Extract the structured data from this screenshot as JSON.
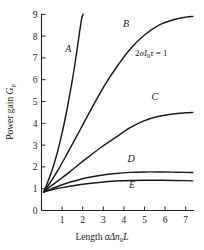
{
  "chart_data": {
    "type": "line",
    "title": "",
    "xlabel": "Length σΔn₀L",
    "ylabel": "Power gain Gₚ",
    "xlim": [
      0,
      7.45
    ],
    "ylim": [
      0,
      9
    ],
    "xticks": [
      1,
      2,
      3,
      4,
      5,
      6,
      7
    ],
    "yticks": [
      0,
      1,
      2,
      3,
      4,
      5,
      6,
      7,
      8,
      9
    ],
    "grid": false,
    "legend": "none",
    "annotations": [
      {
        "text": "2σI₀τ = 1",
        "x": 5.0,
        "y": 7.0
      }
    ],
    "series": [
      {
        "name": "A",
        "label": "A",
        "label_x": 1.3,
        "label_y": 7.25,
        "x": [
          0.1,
          0.3,
          0.6,
          0.9,
          1.2,
          1.5,
          1.7,
          1.85,
          1.95,
          2.02
        ],
        "y": [
          0.85,
          1.3,
          2.1,
          3.15,
          4.45,
          6.0,
          7.2,
          8.2,
          8.8,
          9.0
        ]
      },
      {
        "name": "B",
        "label": "B",
        "label_x": 4.1,
        "label_y": 8.4,
        "x": [
          0.1,
          0.4,
          0.8,
          1.3,
          1.9,
          2.5,
          3.1,
          3.7,
          4.3,
          5.0,
          5.7,
          6.4,
          7.0,
          7.35
        ],
        "y": [
          0.85,
          1.25,
          1.85,
          2.7,
          3.75,
          4.8,
          5.8,
          6.65,
          7.4,
          8.05,
          8.5,
          8.75,
          8.87,
          8.9
        ]
      },
      {
        "name": "C",
        "label": "C",
        "label_x": 5.5,
        "label_y": 5.05,
        "x": [
          0.1,
          0.5,
          1.0,
          1.6,
          2.2,
          2.9,
          3.6,
          4.3,
          5.0,
          5.7,
          6.4,
          7.0,
          7.35
        ],
        "y": [
          0.85,
          1.15,
          1.5,
          1.95,
          2.4,
          2.9,
          3.35,
          3.8,
          4.12,
          4.32,
          4.43,
          4.48,
          4.5
        ]
      },
      {
        "name": "D",
        "label": "D",
        "label_x": 4.35,
        "label_y": 2.22,
        "x": [
          0.1,
          0.5,
          1.0,
          1.6,
          2.2,
          2.9,
          3.6,
          4.3,
          5.0,
          5.7,
          6.4,
          7.0,
          7.35
        ],
        "y": [
          0.85,
          1.0,
          1.18,
          1.35,
          1.5,
          1.62,
          1.7,
          1.75,
          1.77,
          1.77,
          1.76,
          1.75,
          1.74
        ]
      },
      {
        "name": "E",
        "label": "E",
        "label_x": 4.4,
        "label_y": 1.02,
        "x": [
          0.1,
          0.5,
          1.0,
          1.6,
          2.2,
          2.9,
          3.6,
          4.3,
          5.0,
          5.7,
          6.4,
          7.0,
          7.35
        ],
        "y": [
          0.85,
          0.95,
          1.05,
          1.15,
          1.23,
          1.3,
          1.35,
          1.38,
          1.39,
          1.39,
          1.38,
          1.37,
          1.36
        ]
      }
    ]
  },
  "axes": {
    "y_title_main": "Power gain ",
    "y_title_symbol": "G",
    "y_title_subscript": "p",
    "x_title_main": "Length ",
    "x_title_sigma": "σΔn",
    "x_title_subscript": "0",
    "x_title_tail": "L"
  },
  "annotation": {
    "lead": "2",
    "sigma": "σ",
    "intensity": "I",
    "intensity_sub": "0",
    "tau": "τ",
    "equals": " = 1"
  },
  "tick_labels": {
    "x": [
      "1",
      "2",
      "3",
      "4",
      "5",
      "6",
      "7"
    ],
    "y": [
      "0",
      "1",
      "2",
      "3",
      "4",
      "5",
      "6",
      "7",
      "8",
      "9"
    ]
  },
  "curve_labels": [
    "A",
    "B",
    "C",
    "D",
    "E"
  ]
}
